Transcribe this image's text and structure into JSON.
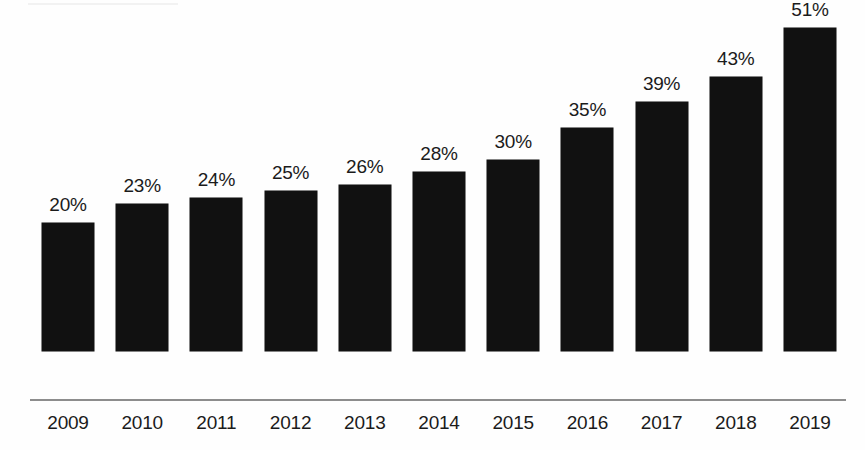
{
  "chart_data": {
    "type": "bar",
    "title": "",
    "subtitle": "",
    "xlabel": "",
    "ylabel": "",
    "ylim": [
      0,
      55
    ],
    "grid": false,
    "legend": null,
    "legend_position": "none",
    "orientation": "vertical",
    "categories": [
      "2009",
      "2010",
      "2011",
      "2012",
      "2013",
      "2014",
      "2015",
      "2016",
      "2017",
      "2018",
      "2019"
    ],
    "values": [
      20,
      23,
      24,
      25,
      26,
      28,
      30,
      35,
      39,
      43,
      51
    ],
    "value_labels": [
      "20%",
      "23%",
      "24%",
      "25%",
      "26%",
      "28%",
      "30%",
      "35%",
      "39%",
      "43%",
      "51%"
    ],
    "value_suffix": "%",
    "bar_color": "#111111",
    "axis_color": "#8d8d8d",
    "label_color": "#1b1b1b",
    "background_color": "#fefefe"
  }
}
